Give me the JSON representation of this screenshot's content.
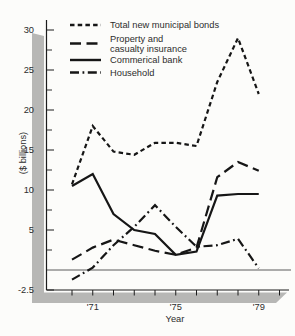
{
  "colors": {
    "ink": "#161616",
    "axis": "#1c1c1c",
    "text": "#2d2d2d",
    "zero_line": "#4a4a4a",
    "shadow": "#b7b7b5",
    "background": "#fcfcfa"
  },
  "chart_data": {
    "type": "line",
    "title": "",
    "ylabel": "($ billions)",
    "xlabel": "Year",
    "grid": false,
    "legend_position": "top-left",
    "years": [
      1970,
      1971,
      1972,
      1973,
      1974,
      1975,
      1976,
      1977,
      1978,
      1979
    ],
    "x_axis": {
      "tick_years": [
        1970,
        1971,
        1972,
        1973,
        1974,
        1975,
        1976,
        1977,
        1978,
        1979,
        1980
      ],
      "labeled_ticks": [
        {
          "year": 1971,
          "label": "'71"
        },
        {
          "year": 1975,
          "label": "'75"
        },
        {
          "year": 1979,
          "label": "'79"
        }
      ]
    },
    "y_axis": {
      "min": -2.5,
      "max": 31,
      "zero_line": true,
      "labeled_ticks": [
        {
          "value": 30,
          "label": "30"
        },
        {
          "value": 25,
          "label": "25"
        },
        {
          "value": 20,
          "label": "20"
        },
        {
          "value": 15,
          "label": "15"
        },
        {
          "value": 10,
          "label": "10"
        },
        {
          "value": 5,
          "label": "5"
        },
        {
          "value": -2.5,
          "label": "-2.5"
        }
      ],
      "minor_ticks": [
        27.5,
        22.5,
        17.5,
        12.5,
        7.5,
        2.5
      ]
    },
    "series": [
      {
        "name": "Total new municipal bonds",
        "legend_lines": [
          "Total new municipal bonds"
        ],
        "line_style": "short-dash",
        "values": [
          10.7,
          18.0,
          14.8,
          14.4,
          15.9,
          15.9,
          15.5,
          23.5,
          29.0,
          22.0
        ]
      },
      {
        "name": "Property and casualty insurance",
        "legend_lines": [
          "Property and",
          "casualty insurance"
        ],
        "line_style": "long-dash",
        "values": [
          1.3,
          2.8,
          3.8,
          3.1,
          2.4,
          1.9,
          2.8,
          11.6,
          13.5,
          12.4
        ]
      },
      {
        "name": "Commerical bank",
        "legend_lines": [
          "Commerical bank"
        ],
        "line_style": "solid",
        "values": [
          10.5,
          12.0,
          7.0,
          5.0,
          4.5,
          1.9,
          2.3,
          9.3,
          9.5,
          9.5
        ]
      },
      {
        "name": "Household",
        "legend_lines": [
          "Household"
        ],
        "line_style": "dash-dot",
        "values": [
          -1.2,
          0.3,
          3.1,
          5.4,
          8.1,
          5.4,
          2.9,
          3.1,
          3.9,
          0.2
        ]
      }
    ]
  }
}
